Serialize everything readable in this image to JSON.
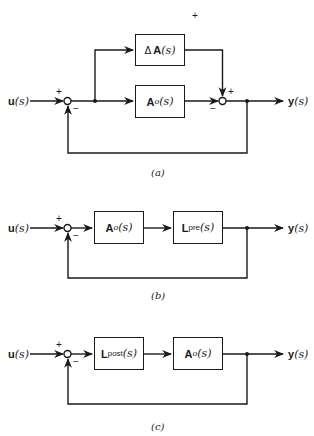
{
  "diagrams": [
    {
      "id": "a",
      "caption": "(a)",
      "input": {
        "symbol": "u",
        "arg": "(s)"
      },
      "output": {
        "symbol": "y",
        "arg": "(s)"
      },
      "blocks": [
        {
          "prefix": "Δ",
          "symbol": "A",
          "sub": "",
          "arg": "(s)"
        },
        {
          "prefix": "",
          "symbol": "A",
          "sub": "o",
          "arg": "(s)"
        }
      ],
      "signs": {
        "sum1_plus": "+",
        "sum1_minus": "−",
        "sum2_plus": "+",
        "sum2_minus": "−",
        "top_plus": "+"
      }
    },
    {
      "id": "b",
      "caption": "(b)",
      "input": {
        "symbol": "u",
        "arg": "(s)"
      },
      "output": {
        "symbol": "y",
        "arg": "(s)"
      },
      "blocks": [
        {
          "prefix": "",
          "symbol": "A",
          "sub": "o",
          "arg": "(s)"
        },
        {
          "prefix": "",
          "symbol": "L",
          "sub": "pre",
          "arg": "(s)"
        }
      ],
      "signs": {
        "sum1_plus": "+",
        "sum1_minus": "−"
      }
    },
    {
      "id": "c",
      "caption": "(c)",
      "input": {
        "symbol": "u",
        "arg": "(s)"
      },
      "output": {
        "symbol": "y",
        "arg": "(s)"
      },
      "blocks": [
        {
          "prefix": "",
          "symbol": "L",
          "sub": "post",
          "arg": "(s)"
        },
        {
          "prefix": "",
          "symbol": "A",
          "sub": "o",
          "arg": "(s)"
        }
      ],
      "signs": {
        "sum1_plus": "+",
        "sum1_minus": "−"
      }
    }
  ]
}
